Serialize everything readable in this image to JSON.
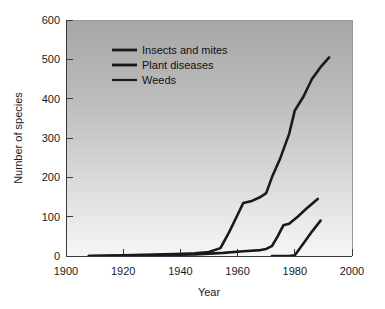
{
  "chart_data": {
    "type": "line",
    "title": "",
    "xlabel": "Year",
    "ylabel": "Number of species",
    "xlim": [
      1900,
      2000
    ],
    "ylim": [
      0,
      600
    ],
    "xticks": [
      1900,
      1920,
      1940,
      1960,
      1980,
      2000
    ],
    "yticks": [
      0,
      100,
      200,
      300,
      400,
      500,
      600
    ],
    "grid": false,
    "legend_position": "upper-left-inside",
    "background": "vertical gradient gray to white",
    "series": [
      {
        "name": "Insects and mites",
        "color": "#1a1a1a",
        "x": [
          1908,
          1920,
          1938,
          1945,
          1950,
          1954,
          1957,
          1960,
          1962,
          1965,
          1968,
          1970,
          1972,
          1975,
          1978,
          1980,
          1983,
          1986,
          1989,
          1992
        ],
        "y": [
          0,
          2,
          5,
          7,
          10,
          20,
          60,
          105,
          135,
          140,
          150,
          160,
          200,
          250,
          310,
          370,
          405,
          450,
          480,
          505
        ]
      },
      {
        "name": "Plant diseases",
        "color": "#1a1a1a",
        "x": [
          1908,
          1930,
          1945,
          1955,
          1962,
          1968,
          1970,
          1972,
          1974,
          1976,
          1978,
          1981,
          1984,
          1988
        ],
        "y": [
          0,
          2,
          4,
          8,
          12,
          15,
          18,
          25,
          50,
          78,
          82,
          100,
          120,
          145
        ]
      },
      {
        "name": "Weeds",
        "color": "#1a1a1a",
        "x": [
          1972,
          1978,
          1980,
          1983,
          1986,
          1989
        ],
        "y": [
          0,
          0,
          2,
          32,
          62,
          90
        ]
      }
    ]
  },
  "axes": {
    "y_tick_labels": [
      "600",
      "500",
      "400",
      "300",
      "200",
      "100",
      "0"
    ],
    "x_tick_labels": [
      "1900",
      "1920",
      "1940",
      "1960",
      "1980",
      "2000"
    ],
    "y_axis_title": "Number of species",
    "x_axis_title": "Year"
  },
  "legend": {
    "entries": [
      {
        "label": "Insects and mites"
      },
      {
        "label": "Plant diseases"
      },
      {
        "label": "Weeds"
      }
    ]
  },
  "colors": {
    "line": "#1a1a1a",
    "axis": "#3a3a3a",
    "text": "#1a1a1a",
    "plot_bg_top": "#a9a9a9",
    "plot_bg_bottom": "#f4f4f4"
  }
}
